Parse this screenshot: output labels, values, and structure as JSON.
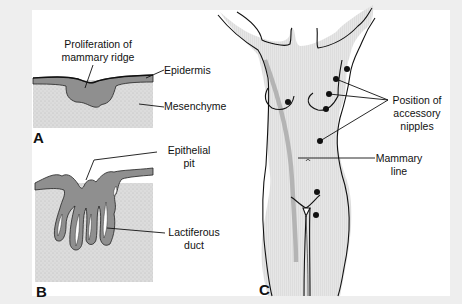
{
  "figure": {
    "panels": [
      {
        "id": "A",
        "letter": "A",
        "labels": {
          "proliferation_line1": "Proliferation of",
          "proliferation_line2": "mammary ridge",
          "epidermis": "Epidermis",
          "mesenchyme": "Mesenchyme"
        }
      },
      {
        "id": "B",
        "letter": "B",
        "labels": {
          "pit_line1": "Epithelial",
          "pit_line2": "pit",
          "duct_line1": "Lactiferous",
          "duct_line2": "duct"
        }
      },
      {
        "id": "C",
        "letter": "C",
        "labels": {
          "nipples_line1": "Position of",
          "nipples_line2": "accessory",
          "nipples_line3": "nipples",
          "mammary_line1": "Mammary",
          "mammary_line2": "line"
        }
      }
    ]
  },
  "colors": {
    "background": "#eeeeee",
    "panel": "#ffffff",
    "epithelium": "#8e8e8e",
    "mesenchyme": "#dadada",
    "body_fill": "#e4e4e4",
    "mammary_line": "#b4b4b4",
    "ink": "#111111"
  }
}
